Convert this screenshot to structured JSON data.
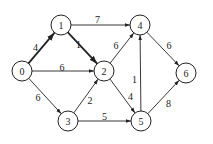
{
  "diagram": {
    "type": "weighted-directed-graph",
    "nodes": [
      {
        "id": "0",
        "label": "0"
      },
      {
        "id": "1",
        "label": "1"
      },
      {
        "id": "2",
        "label": "2"
      },
      {
        "id": "3",
        "label": "3"
      },
      {
        "id": "4",
        "label": "4"
      },
      {
        "id": "5",
        "label": "5"
      },
      {
        "id": "6",
        "label": "6"
      }
    ],
    "edges": [
      {
        "from": "0",
        "to": "1",
        "weight": "4",
        "highlighted": true
      },
      {
        "from": "1",
        "to": "2",
        "weight": "1",
        "highlighted": true
      },
      {
        "from": "0",
        "to": "2",
        "weight": "6",
        "highlighted": false
      },
      {
        "from": "1",
        "to": "4",
        "weight": "7",
        "highlighted": false
      },
      {
        "from": "2",
        "to": "4",
        "weight": "6",
        "highlighted": false
      },
      {
        "from": "0",
        "to": "3",
        "weight": "6",
        "highlighted": false
      },
      {
        "from": "3",
        "to": "2",
        "weight": "2",
        "highlighted": false
      },
      {
        "from": "3",
        "to": "5",
        "weight": "5",
        "highlighted": false
      },
      {
        "from": "2",
        "to": "5",
        "weight": "4",
        "highlighted": false
      },
      {
        "from": "5",
        "to": "4",
        "weight": "1",
        "highlighted": false
      },
      {
        "from": "4",
        "to": "6",
        "weight": "6",
        "highlighted": false
      },
      {
        "from": "5",
        "to": "6",
        "weight": "8",
        "highlighted": false
      }
    ]
  }
}
